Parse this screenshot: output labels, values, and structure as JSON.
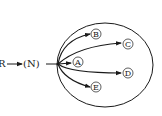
{
  "diagram": {
    "source_label": "R",
    "intermediate_label": "(N)",
    "circled_nodes": [
      {
        "id": "B",
        "label": "B"
      },
      {
        "id": "C",
        "label": "C"
      },
      {
        "id": "A",
        "label": "A"
      },
      {
        "id": "D",
        "label": "D"
      },
      {
        "id": "E",
        "label": "E"
      }
    ],
    "colors": {
      "stroke": "#1a1a1a",
      "background": "#ffffff"
    }
  }
}
